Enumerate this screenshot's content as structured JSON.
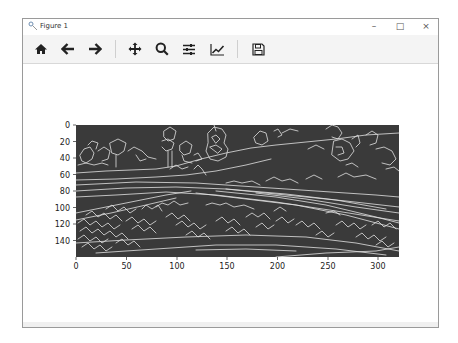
{
  "window": {
    "title": "Figure 1",
    "controls": {
      "minimize": "–",
      "maximize": "□",
      "close": "×"
    }
  },
  "toolbar": {
    "buttons": [
      {
        "name": "home",
        "icon": "home-icon",
        "tooltip": "Reset original view"
      },
      {
        "name": "back",
        "icon": "arrow-left-icon",
        "tooltip": "Back to previous view"
      },
      {
        "name": "forward",
        "icon": "arrow-right-icon",
        "tooltip": "Forward to next view"
      },
      {
        "name": "pan",
        "icon": "move-icon",
        "tooltip": "Pan axes"
      },
      {
        "name": "zoom",
        "icon": "magnifier-icon",
        "tooltip": "Zoom to rectangle"
      },
      {
        "name": "configure",
        "icon": "sliders-icon",
        "tooltip": "Configure subplots"
      },
      {
        "name": "edit",
        "icon": "line-chart-icon",
        "tooltip": "Edit axis, curve and image parameters"
      },
      {
        "name": "save",
        "icon": "floppy-disk-icon",
        "tooltip": "Save the figure"
      }
    ]
  },
  "plot": {
    "image_description": "Canny edge-detected road scene",
    "background_color": "#3a3a3a",
    "edge_color": "#e6e6e6",
    "x_ticks": [
      "0",
      "50",
      "100",
      "150",
      "200",
      "250",
      "300"
    ],
    "y_ticks": [
      "0",
      "20",
      "40",
      "60",
      "80",
      "100",
      "120",
      "140"
    ],
    "x_range": [
      0,
      320
    ],
    "y_range": [
      0,
      160
    ]
  }
}
